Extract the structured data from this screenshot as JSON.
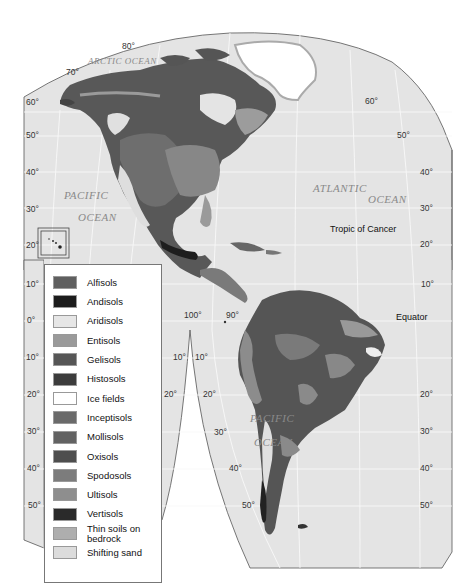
{
  "map": {
    "title": "Soil orders of the Americas",
    "oceans": {
      "arctic": "ARCTIC OCEAN",
      "pacific_north_1": "PACIFIC",
      "pacific_north_2": "OCEAN",
      "atlantic_1": "ATLANTIC",
      "atlantic_2": "OCEAN",
      "pacific_south_1": "PACIFIC",
      "pacific_south_2": "OCEAN"
    },
    "annotations": {
      "tropic": "Tropic of Cancer",
      "equator": "Equator"
    },
    "latitude_labels_left": [
      "60°",
      "50°",
      "40°",
      "30°",
      "20°",
      "10°",
      "0°",
      "10°",
      "20°",
      "30°",
      "40°",
      "50°"
    ],
    "latitude_labels_right": [
      "60°",
      "50°",
      "40°",
      "30°",
      "20°",
      "10°",
      "20°",
      "30°",
      "40°",
      "50°"
    ],
    "top_labels": {
      "lat80": "80°",
      "lat70": "70°"
    },
    "meridian_labels": {
      "lon100": "100°",
      "lon90": "90°"
    },
    "gore_labels": {
      "left10": "10°",
      "right10": "10°",
      "left20": "20°",
      "right20": "20°",
      "sa20": "20°",
      "sa30": "30°",
      "sa40": "40°",
      "sa50": "50°"
    },
    "colors": {
      "ocean": "#e4e4e4",
      "graticule": "#f7f7f7",
      "outline": "#555555"
    }
  },
  "legend": {
    "items": [
      {
        "label": "Alfisols",
        "color": "#5f5f5f"
      },
      {
        "label": "Andisols",
        "color": "#1c1c1c"
      },
      {
        "label": "Aridisols",
        "color": "#e6e6e6"
      },
      {
        "label": "Entisols",
        "color": "#9a9a9a"
      },
      {
        "label": "Gelisols",
        "color": "#565656"
      },
      {
        "label": "Histosols",
        "color": "#3c3c3c"
      },
      {
        "label": "Ice fields",
        "color": "#ffffff"
      },
      {
        "label": "Inceptisols",
        "color": "#6a6a6a"
      },
      {
        "label": "Mollisols",
        "color": "#626262"
      },
      {
        "label": "Oxisols",
        "color": "#4e4e4e"
      },
      {
        "label": "Spodosols",
        "color": "#7c7c7c"
      },
      {
        "label": "Ultisols",
        "color": "#8e8e8e"
      },
      {
        "label": "Vertisols",
        "color": "#2a2a2a"
      },
      {
        "label": "Thin soils on bedrock",
        "color": "#aeaeae"
      },
      {
        "label": "Shifting sand",
        "color": "#dcdcdc"
      }
    ]
  }
}
